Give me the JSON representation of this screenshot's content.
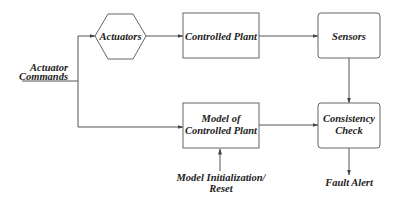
{
  "diagram": {
    "nodes": {
      "actuators": {
        "label": "Actuators",
        "shape": "hexagon"
      },
      "controlled_plant": {
        "label": "Controlled Plant",
        "shape": "rectangle"
      },
      "sensors": {
        "label": "Sensors",
        "shape": "rounded-rectangle"
      },
      "model": {
        "label_line1": "Model of",
        "label_line2": "Controlled Plant",
        "shape": "rectangle"
      },
      "consistency": {
        "label_line1": "Consistency",
        "label_line2": "Check",
        "shape": "rounded-rectangle"
      }
    },
    "external_labels": {
      "actuator_commands_line1": "Actuator",
      "actuator_commands_line2": "Commands",
      "model_init_line1": "Model Initialization/",
      "model_init_line2": "Reset",
      "fault_alert": "Fault Alert"
    },
    "edges": [
      {
        "from": "Actuator Commands",
        "to": "Actuators"
      },
      {
        "from": "Actuator Commands",
        "to": "Model of Controlled Plant"
      },
      {
        "from": "Actuators",
        "to": "Controlled Plant"
      },
      {
        "from": "Controlled Plant",
        "to": "Sensors"
      },
      {
        "from": "Sensors",
        "to": "Consistency Check"
      },
      {
        "from": "Model of Controlled Plant",
        "to": "Consistency Check"
      },
      {
        "from": "Model Initialization/Reset",
        "to": "Model of Controlled Plant"
      },
      {
        "from": "Consistency Check",
        "to": "Fault Alert"
      }
    ],
    "colors": {
      "stroke": "#666666",
      "text": "#222222",
      "background": "#ffffff"
    }
  }
}
